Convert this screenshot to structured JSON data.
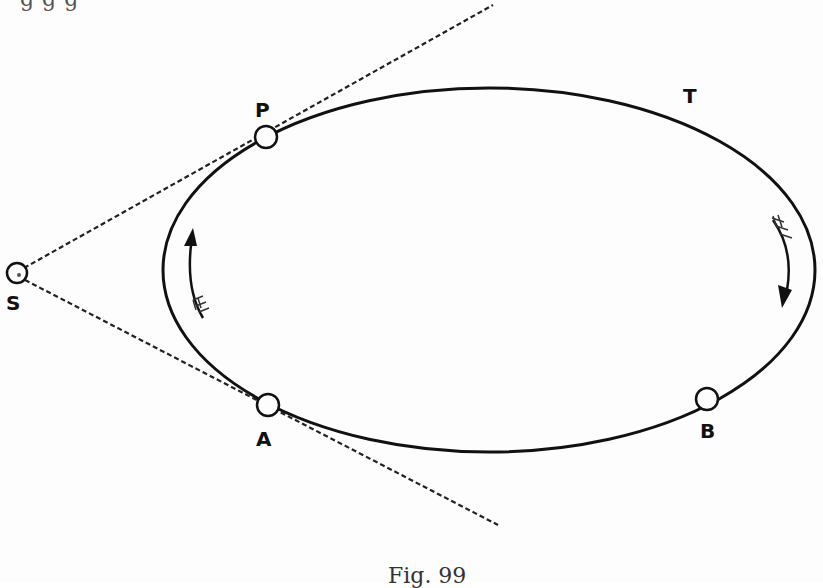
{
  "figure": {
    "caption": "Fig. 99",
    "previous_text_fragment": "g g    g",
    "labels": {
      "S": "S",
      "P": "P",
      "T": "T",
      "A": "A",
      "B": "B"
    },
    "orbit": {
      "type": "ellipse",
      "cx": 489,
      "cy": 270,
      "rx": 326,
      "ry": 182
    },
    "points": [
      {
        "name": "S",
        "x": 17,
        "y": 273,
        "role": "observer / external point"
      },
      {
        "name": "P",
        "x": 266,
        "y": 137,
        "role": "tangent point (upper)"
      },
      {
        "name": "A",
        "x": 268,
        "y": 405,
        "role": "tangent point (lower)"
      },
      {
        "name": "B",
        "x": 707,
        "y": 399,
        "role": "point on orbit"
      }
    ],
    "tangent_lines": [
      {
        "from": "S",
        "through": "P",
        "end": [
          493,
          5
        ],
        "style": "dashed"
      },
      {
        "from": "S",
        "through": "A",
        "end": [
          498,
          525
        ],
        "style": "dashed"
      }
    ],
    "direction_arrows": [
      {
        "side": "left",
        "direction": "up"
      },
      {
        "side": "right",
        "direction": "down"
      }
    ],
    "colors": {
      "ink": "#111111",
      "paper": "#fdfdfd"
    }
  }
}
